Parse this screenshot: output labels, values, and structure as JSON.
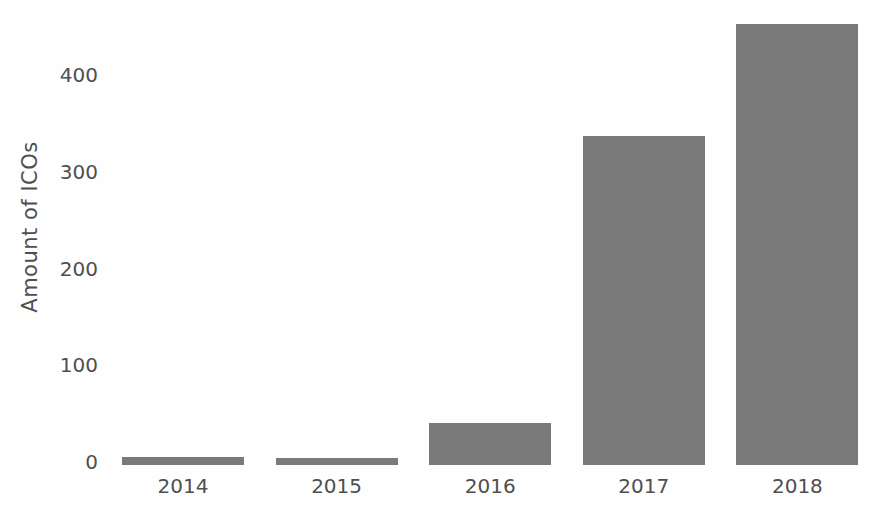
{
  "chart_data": {
    "type": "bar",
    "categories": [
      "2014",
      "2015",
      "2016",
      "2017",
      "2018"
    ],
    "values": [
      8,
      7,
      43,
      340,
      456
    ],
    "ylabel": "Amount of ICOs",
    "yticks": [
      0,
      100,
      200,
      300,
      400
    ],
    "ylim": [
      0,
      480
    ],
    "grid": false,
    "legend": false,
    "bar_color": "#7a7a7a",
    "text_color": "#4f4f4f",
    "background_color": "#fefefe"
  }
}
